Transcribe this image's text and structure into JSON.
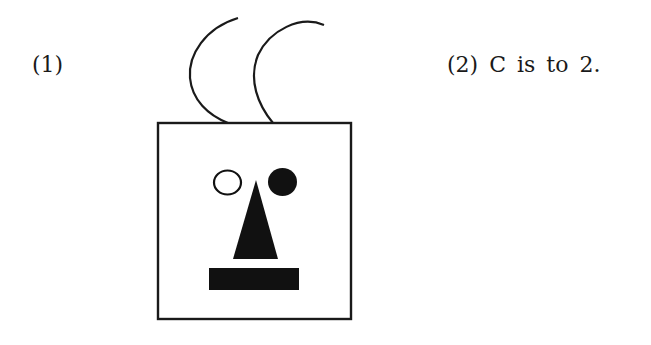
{
  "labels": {
    "item_1": "(1)",
    "item_2": "(2) C is to 2."
  },
  "figure": {
    "stroke_color": "#1a1a1a",
    "fill_color": "#111111",
    "background": "#ffffff",
    "parts": [
      "left-antenna",
      "right-antenna",
      "head-square",
      "left-eye-open-circle",
      "right-eye-filled-circle",
      "nose-triangle",
      "mouth-rectangle"
    ]
  }
}
